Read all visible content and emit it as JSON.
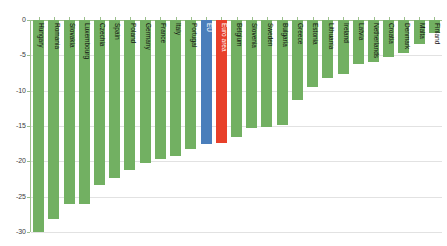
{
  "chart_data": {
    "type": "bar",
    "title": "",
    "subtitle": "",
    "xlabel": "",
    "ylabel": "",
    "ylim": [
      -30,
      0
    ],
    "yticks": [
      0,
      -5,
      -10,
      -15,
      -20,
      -25,
      -30
    ],
    "ytick_labels": [
      "0",
      "-5",
      "-10",
      "-15",
      "-20",
      "-25",
      "-30"
    ],
    "grid": true,
    "legend": "none",
    "orientation": "vertical",
    "categories": [
      "Hungary",
      "Romania",
      "Slovakia",
      "Luxembourg",
      "Czechia",
      "Spain",
      "Poland",
      "Germany",
      "France",
      "Italy",
      "Portugal",
      "EU",
      "Euro area",
      "Belgium",
      "Slovenia",
      "Sweden",
      "Bulgaria",
      "Greece",
      "Estonia",
      "Lithuania",
      "Ireland",
      "Latvia",
      "Netherlands",
      "Croatia",
      "Denmark",
      "Malta",
      "Finland"
    ],
    "values": [
      -30.0,
      -28.2,
      -26.0,
      -26.0,
      -23.3,
      -22.3,
      -21.2,
      -20.3,
      -19.7,
      -19.2,
      -18.3,
      -17.5,
      -17.4,
      -16.6,
      -15.3,
      -15.2,
      -14.9,
      -11.3,
      -9.5,
      -8.2,
      -7.6,
      -6.2,
      -5.9,
      -5.2,
      -4.6,
      -3.4,
      -1.8
    ],
    "bar_colors": [
      "green",
      "green",
      "green",
      "green",
      "green",
      "green",
      "green",
      "green",
      "green",
      "green",
      "green",
      "blue",
      "red",
      "green",
      "green",
      "green",
      "green",
      "green",
      "green",
      "green",
      "green",
      "green",
      "green",
      "green",
      "green",
      "green",
      "green"
    ]
  },
  "colors": {
    "green": "#72b062",
    "blue": "#4a7ebb",
    "red": "#e8402a",
    "gridline": "#e2e2e2",
    "axis": "#9cc08c",
    "tick_text": "#3d3d3d",
    "background": "#ffffff"
  }
}
